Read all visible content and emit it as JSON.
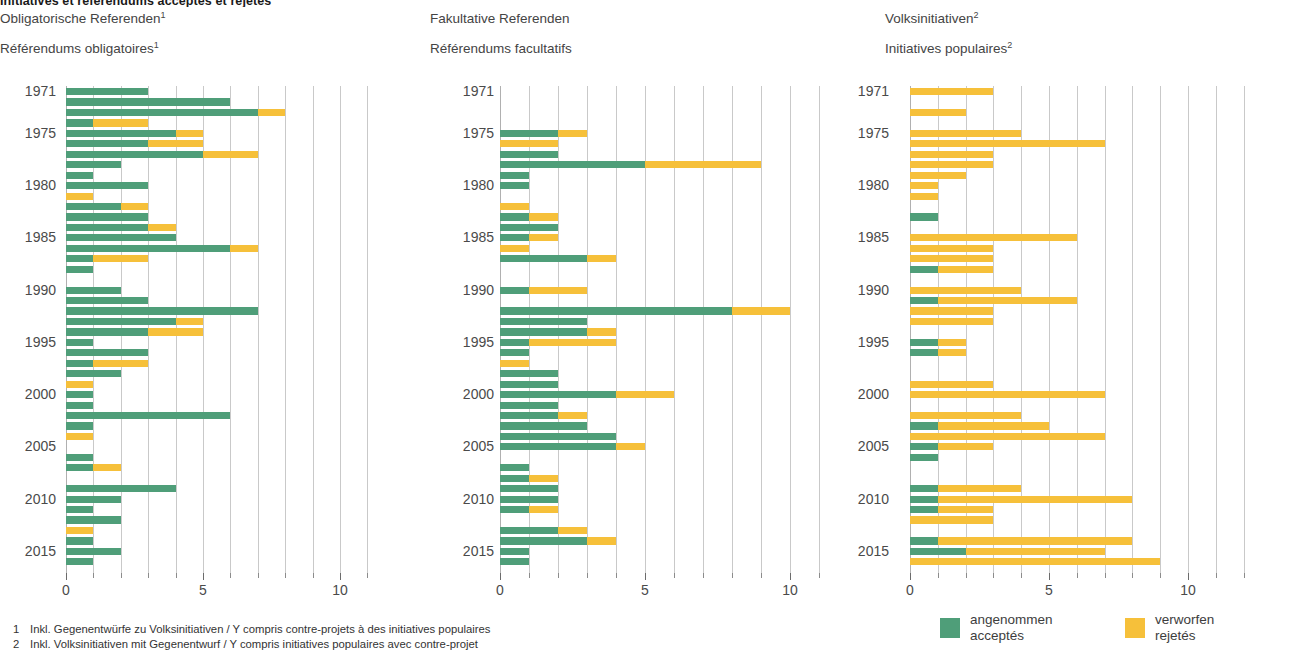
{
  "title": "Initiatives et référendums acceptés et rejetés",
  "panels": [
    {
      "id": "obligatory",
      "heading_de": "Obligatorische Referenden",
      "heading_de_sup": "1",
      "heading_fr": "Référendums obligatoires",
      "heading_fr_sup": "1"
    },
    {
      "id": "optional",
      "heading_de": "Fakultative Referenden",
      "heading_de_sup": "",
      "heading_fr": "Référendums facultatifs",
      "heading_fr_sup": ""
    },
    {
      "id": "initiatives",
      "heading_de": "Volksinitiativen",
      "heading_de_sup": "2",
      "heading_fr": "Initiatives populaires",
      "heading_fr_sup": "2"
    }
  ],
  "year_labels": [
    "1971",
    "1975",
    "1980",
    "1985",
    "1990",
    "1995",
    "2000",
    "2005",
    "2010",
    "2015"
  ],
  "x_tick_labels_small": [
    "0",
    "5",
    "10"
  ],
  "legend": {
    "accepted": {
      "de": "angenommen",
      "fr": "acceptés",
      "color": "#4f9e79"
    },
    "rejected": {
      "de": "verworfen",
      "fr": "rejetés",
      "color": "#f6c03a"
    }
  },
  "footnotes": [
    {
      "num": "1",
      "text": "Inkl. Gegenentwürfe zu Volksinitiativen / Y compris contre-projets à des initiatives populaires"
    },
    {
      "num": "2",
      "text": "Inkl. Volksinitiativen mit Gegenentwurf / Y compris initiatives populaires avec contre-projet"
    }
  ],
  "chart_data": [
    {
      "type": "bar",
      "orientation": "horizontal",
      "stacked": true,
      "title": "Obligatorische Referenden / Référendums obligatoires",
      "xlabel": "",
      "ylabel": "",
      "xlim": [
        0,
        11
      ],
      "ylim_years": [
        1971,
        2016
      ],
      "grid": "vertical gridlines every 1 unit",
      "tick_labels": [
        "0",
        "5",
        "10"
      ],
      "tick_values": [
        0,
        5,
        10
      ],
      "series": [
        {
          "name": "angenommen / acceptés",
          "color": "#4f9e79"
        },
        {
          "name": "verworfen / rejetés",
          "color": "#f6c03a"
        }
      ],
      "years": [
        1971,
        1972,
        1973,
        1974,
        1975,
        1976,
        1977,
        1978,
        1979,
        1980,
        1981,
        1982,
        1983,
        1984,
        1985,
        1986,
        1987,
        1988,
        1989,
        1990,
        1991,
        1992,
        1993,
        1994,
        1995,
        1996,
        1997,
        1998,
        1999,
        2000,
        2001,
        2002,
        2003,
        2004,
        2005,
        2006,
        2007,
        2008,
        2009,
        2010,
        2011,
        2012,
        2013,
        2014,
        2015,
        2016
      ],
      "accepted": [
        3,
        6,
        7,
        1,
        4,
        3,
        5,
        2,
        1,
        3,
        0,
        2,
        3,
        3,
        4,
        6,
        1,
        1,
        0,
        2,
        3,
        7,
        4,
        3,
        1,
        3,
        1,
        2,
        0,
        1,
        1,
        6,
        1,
        0,
        0,
        1,
        1,
        0,
        4,
        2,
        1,
        2,
        0,
        1,
        2,
        1
      ],
      "rejected": [
        0,
        0,
        1,
        2,
        1,
        2,
        2,
        0,
        0,
        0,
        1,
        1,
        0,
        1,
        0,
        1,
        2,
        0,
        0,
        0,
        0,
        0,
        1,
        2,
        0,
        0,
        2,
        0,
        1,
        0,
        0,
        0,
        0,
        1,
        0,
        0,
        1,
        0,
        0,
        0,
        0,
        0,
        1,
        0,
        0,
        0
      ]
    },
    {
      "type": "bar",
      "orientation": "horizontal",
      "stacked": true,
      "title": "Fakultative Referenden / Référendums facultatifs",
      "xlabel": "",
      "ylabel": "",
      "xlim": [
        0,
        11
      ],
      "ylim_years": [
        1971,
        2016
      ],
      "grid": "vertical gridlines every 1 unit",
      "tick_labels": [
        "0",
        "5",
        "10"
      ],
      "tick_values": [
        0,
        5,
        10
      ],
      "series": [
        {
          "name": "angenommen / acceptés",
          "color": "#4f9e79"
        },
        {
          "name": "verworfen / rejetés",
          "color": "#f6c03a"
        }
      ],
      "years": [
        1971,
        1972,
        1973,
        1974,
        1975,
        1976,
        1977,
        1978,
        1979,
        1980,
        1981,
        1982,
        1983,
        1984,
        1985,
        1986,
        1987,
        1988,
        1989,
        1990,
        1991,
        1992,
        1993,
        1994,
        1995,
        1996,
        1997,
        1998,
        1999,
        2000,
        2001,
        2002,
        2003,
        2004,
        2005,
        2006,
        2007,
        2008,
        2009,
        2010,
        2011,
        2012,
        2013,
        2014,
        2015,
        2016
      ],
      "accepted": [
        0,
        0,
        0,
        0,
        2,
        0,
        2,
        5,
        1,
        1,
        0,
        0,
        1,
        2,
        1,
        0,
        3,
        0,
        0,
        1,
        0,
        8,
        3,
        3,
        1,
        1,
        0,
        2,
        2,
        4,
        2,
        2,
        3,
        4,
        4,
        0,
        1,
        1,
        2,
        2,
        1,
        0,
        2,
        3,
        1,
        1
      ],
      "rejected": [
        0,
        0,
        0,
        0,
        1,
        2,
        0,
        4,
        0,
        0,
        0,
        1,
        1,
        0,
        1,
        1,
        1,
        0,
        0,
        2,
        0,
        2,
        0,
        1,
        3,
        0,
        1,
        0,
        0,
        2,
        0,
        1,
        0,
        0,
        1,
        0,
        0,
        1,
        0,
        0,
        1,
        0,
        1,
        1,
        0,
        0
      ]
    },
    {
      "type": "bar",
      "orientation": "horizontal",
      "stacked": true,
      "title": "Volksinitiativen / Initiatives populaires",
      "xlabel": "",
      "ylabel": "",
      "xlim": [
        0,
        12
      ],
      "ylim_years": [
        1971,
        2016
      ],
      "grid": "vertical gridlines every 1 unit",
      "tick_labels": [
        "0",
        "5",
        "10"
      ],
      "tick_values": [
        0,
        5,
        10
      ],
      "series": [
        {
          "name": "angenommen / acceptés",
          "color": "#4f9e79"
        },
        {
          "name": "verworfen / rejetés",
          "color": "#f6c03a"
        }
      ],
      "years": [
        1971,
        1972,
        1973,
        1974,
        1975,
        1976,
        1977,
        1978,
        1979,
        1980,
        1981,
        1982,
        1983,
        1984,
        1985,
        1986,
        1987,
        1988,
        1989,
        1990,
        1991,
        1992,
        1993,
        1994,
        1995,
        1996,
        1997,
        1998,
        1999,
        2000,
        2001,
        2002,
        2003,
        2004,
        2005,
        2006,
        2007,
        2008,
        2009,
        2010,
        2011,
        2012,
        2013,
        2014,
        2015,
        2016
      ],
      "accepted": [
        0,
        0,
        0,
        0,
        0,
        0,
        0,
        0,
        0,
        0,
        0,
        0,
        1,
        0,
        0,
        0,
        0,
        1,
        0,
        0,
        1,
        0,
        0,
        0,
        1,
        1,
        0,
        0,
        0,
        0,
        0,
        0,
        1,
        0,
        1,
        1,
        0,
        0,
        1,
        1,
        1,
        0,
        0,
        1,
        2,
        0
      ],
      "rejected": [
        3,
        0,
        2,
        0,
        4,
        7,
        3,
        3,
        2,
        1,
        1,
        0,
        0,
        0,
        6,
        3,
        3,
        2,
        0,
        4,
        5,
        3,
        3,
        0,
        1,
        1,
        0,
        0,
        3,
        7,
        0,
        4,
        4,
        7,
        2,
        0,
        0,
        0,
        3,
        7,
        2,
        3,
        0,
        7,
        5,
        9
      ]
    }
  ]
}
